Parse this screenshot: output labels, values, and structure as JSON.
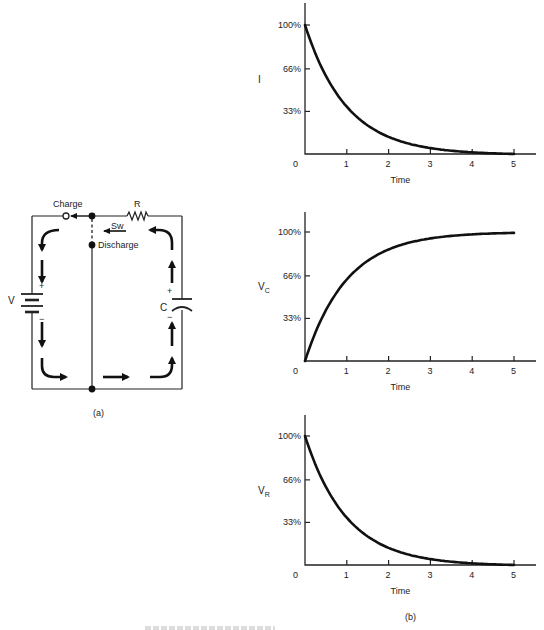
{
  "figure": {
    "panel_a_label": "(a)",
    "panel_b_label": "(b)",
    "caption_partial": "FIGURE ..."
  },
  "circuit": {
    "charge_label": "Charge",
    "discharge_label": "Discharge",
    "resistor_label": "R",
    "switch_label": "Sw",
    "battery_label": "V",
    "capacitor_label": "C",
    "plus": "+",
    "minus": "−"
  },
  "chart_data": [
    {
      "type": "line",
      "title": "",
      "ylabel": "I",
      "xlabel": "Time",
      "x_ticks": [
        "0",
        "1",
        "2",
        "3",
        "4",
        "5"
      ],
      "y_ticks": [
        "33%",
        "66%",
        "100%"
      ],
      "xlim": [
        0,
        5.5
      ],
      "ylim": [
        0,
        115
      ],
      "grid": false,
      "series": [
        {
          "name": "I",
          "x": [
            0,
            0.5,
            1,
            1.5,
            2,
            2.5,
            3,
            3.5,
            4,
            4.5,
            5
          ],
          "values": [
            100,
            61,
            37,
            22,
            14,
            8,
            5,
            3,
            2,
            1,
            0
          ]
        }
      ]
    },
    {
      "type": "line",
      "title": "",
      "ylabel": "VC",
      "ylabel_main": "V",
      "ylabel_sub": "C",
      "xlabel": "Time",
      "x_ticks": [
        "0",
        "1",
        "2",
        "3",
        "4",
        "5"
      ],
      "y_ticks": [
        "33%",
        "66%",
        "100%"
      ],
      "xlim": [
        0,
        5.5
      ],
      "ylim": [
        0,
        115
      ],
      "grid": false,
      "series": [
        {
          "name": "VC",
          "x": [
            0,
            0.5,
            1,
            1.5,
            2,
            2.5,
            3,
            3.5,
            4,
            4.5,
            5
          ],
          "values": [
            0,
            39,
            63,
            78,
            86,
            92,
            95,
            97,
            98,
            99,
            100
          ]
        }
      ]
    },
    {
      "type": "line",
      "title": "",
      "ylabel": "VR",
      "ylabel_main": "V",
      "ylabel_sub": "R",
      "xlabel": "Time",
      "x_ticks": [
        "0",
        "1",
        "2",
        "3",
        "4",
        "5"
      ],
      "y_ticks": [
        "33%",
        "66%",
        "100%"
      ],
      "xlim": [
        0,
        5.5
      ],
      "ylim": [
        0,
        115
      ],
      "grid": false,
      "series": [
        {
          "name": "VR",
          "x": [
            0,
            0.5,
            1,
            1.5,
            2,
            2.5,
            3,
            3.5,
            4,
            4.5,
            5
          ],
          "values": [
            100,
            61,
            37,
            22,
            14,
            8,
            5,
            3,
            2,
            1,
            0
          ]
        }
      ]
    }
  ]
}
